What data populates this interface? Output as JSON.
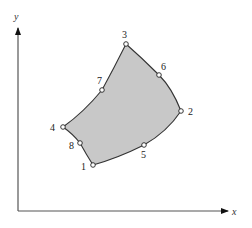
{
  "diagram": {
    "type": "curvilinear-quadrilateral-element",
    "axes": {
      "x_label": "x",
      "y_label": "y"
    },
    "region_fill": "#c8c8c8",
    "outline_color": "#333333",
    "nodes": [
      {
        "id": "1",
        "label": "1"
      },
      {
        "id": "2",
        "label": "2"
      },
      {
        "id": "3",
        "label": "3"
      },
      {
        "id": "4",
        "label": "4"
      },
      {
        "id": "5",
        "label": "5"
      },
      {
        "id": "6",
        "label": "6"
      },
      {
        "id": "7",
        "label": "7"
      },
      {
        "id": "8",
        "label": "8"
      }
    ],
    "edges": [
      {
        "from": "1",
        "mid": "5",
        "to": "2"
      },
      {
        "from": "2",
        "mid": "6",
        "to": "3"
      },
      {
        "from": "3",
        "mid": "7",
        "to": "4"
      },
      {
        "from": "4",
        "mid": "8",
        "to": "1"
      }
    ]
  }
}
